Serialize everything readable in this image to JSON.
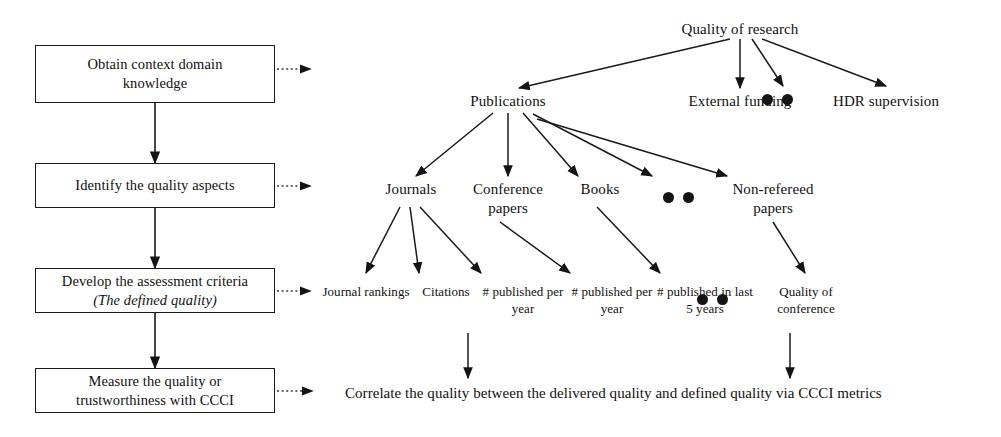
{
  "diagram": {
    "colors": {
      "ink": "#1a1a1a",
      "dot": "#141414",
      "background": "#ffffff"
    },
    "process_boxes": [
      {
        "name": "obtain-context-domain-knowledge",
        "line1": "Obtain context domain",
        "line2": "knowledge",
        "line2_italic": false
      },
      {
        "name": "identify-the-quality-aspects",
        "line1": "Identify the quality aspects",
        "line2": "",
        "line2_italic": false
      },
      {
        "name": "develop-the-assessment-criteria",
        "line1": "Develop the assessment criteria",
        "line2": "(The defined quality)",
        "line2_italic": true
      },
      {
        "name": "measure-the-quality-or-trustworthiness",
        "line1": "Measure the quality or",
        "line2": "trustworthiness with CCCI",
        "line2_italic": false
      }
    ],
    "tree": {
      "root": "Quality of research",
      "level1": [
        "Publications",
        "External funding",
        "HDR supervision"
      ],
      "level2": [
        "Journals",
        "Conference papers",
        "Books",
        "Non-refereed papers"
      ],
      "leaves": [
        "Journal rankings",
        "Citations",
        "# published per year",
        "# published per year",
        "# published in last 5 years",
        "Quality of conference"
      ]
    },
    "caption": "Correlate the quality between the delivered quality and defined quality via CCCI metrics",
    "ellipsis_groups": [
      {
        "name": "ellipsis-level1",
        "dots": 2
      },
      {
        "name": "ellipsis-level2",
        "dots": 2
      },
      {
        "name": "ellipsis-leaves",
        "dots": 2
      }
    ]
  }
}
